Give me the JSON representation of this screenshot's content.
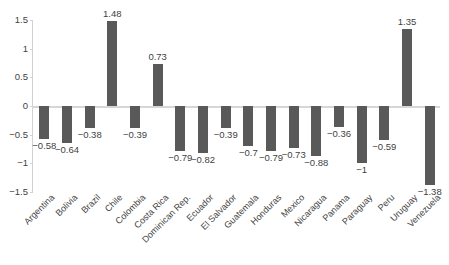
{
  "chart_data": {
    "type": "bar",
    "title": "",
    "subtitle": "",
    "xlabel": "",
    "ylabel": "",
    "ylim": [
      -1.5,
      1.5
    ],
    "grid": false,
    "legend": null,
    "bar_color": "#595959",
    "axis_color": "#d6d6d6",
    "label_color": "#3f3f3f",
    "y_ticks": [
      "1.5",
      "1",
      "0.5",
      "0",
      "-0.5",
      "-1",
      "-1.5"
    ],
    "y_tick_values": [
      1.5,
      1,
      0.5,
      0,
      -0.5,
      -1,
      -1.5
    ],
    "categories": [
      "Argentina",
      "Bolivia",
      "Brazil",
      "Chile",
      "Colombia",
      "Costa Rica",
      "Dominican Rep.",
      "Ecuador",
      "El Salvador",
      "Guatemala",
      "Honduras",
      "Mexico",
      "Nicaragua",
      "Panama",
      "Paraguay",
      "Peru",
      "Uruguay",
      "Venezuela"
    ],
    "values": [
      -0.58,
      -0.64,
      -0.38,
      1.48,
      -0.39,
      0.73,
      -0.79,
      -0.82,
      -0.39,
      -0.7,
      -0.79,
      -0.73,
      -0.88,
      -0.36,
      -1,
      -0.59,
      1.35,
      -1.38
    ],
    "data_labels": [
      "-0.58",
      "-0.64",
      "-0.38",
      "1.48",
      "-0.39",
      "0.73",
      "-0.79",
      "-0.82",
      "-0.39",
      "-0.7",
      "-0.79",
      "-0.73",
      "-0.88",
      "-0.36",
      "-1",
      "-0.59",
      "1.35",
      "-1.38"
    ]
  }
}
